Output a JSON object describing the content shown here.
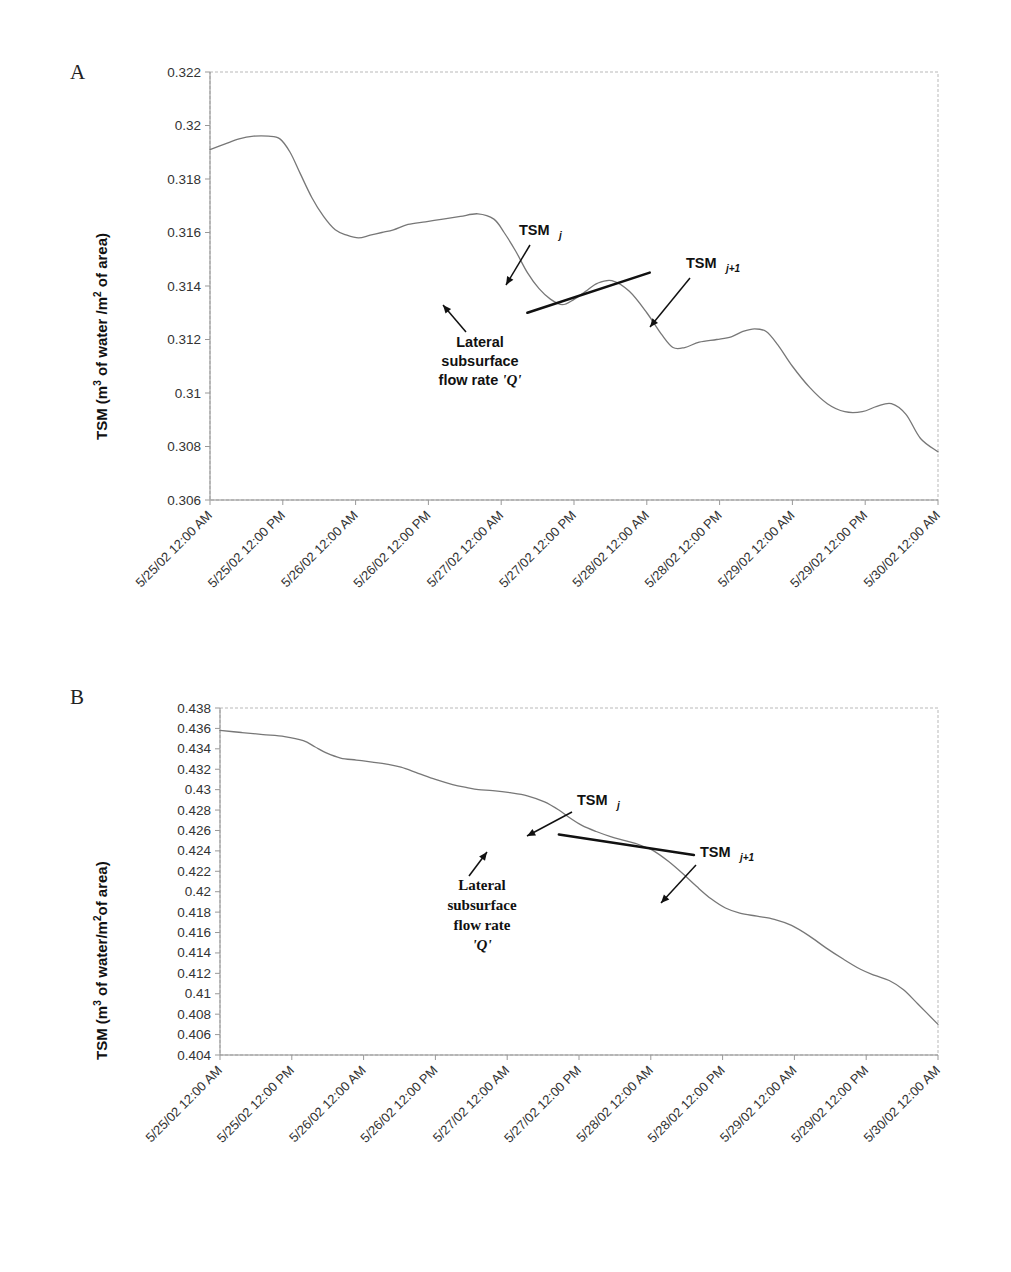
{
  "figure": {
    "panels": [
      {
        "letter": "A",
        "ylabel_prefix": "TSM (m",
        "ylabel_sup1": "3",
        "ylabel_mid": " of water /m",
        "ylabel_sup2": "2",
        "ylabel_suffix": " of area)",
        "annotations": {
          "tsm_j": "TSM",
          "tsm_j_sub": "j",
          "tsm_j1": "TSM",
          "tsm_j1_sub": "j+1",
          "lateral_line1": "Lateral",
          "lateral_line2": "subsurface",
          "lateral_line3": "flow rate",
          "lateral_q": "'Q'"
        }
      },
      {
        "letter": "B",
        "ylabel_prefix": "TSM (m",
        "ylabel_sup1": "3",
        "ylabel_mid": " of water/m",
        "ylabel_sup2": "2",
        "ylabel_suffix": "of area)",
        "annotations": {
          "tsm_j": "TSM",
          "tsm_j_sub": "j",
          "tsm_j1": "TSM",
          "tsm_j1_sub": "j+1",
          "lateral_line1": "Lateral",
          "lateral_line2": "subsurface",
          "lateral_line3": "flow rate",
          "lateral_q": "'Q'"
        }
      }
    ]
  },
  "chart_data": [
    {
      "type": "line",
      "panel": "A",
      "title": "",
      "xlabel": "",
      "ylabel": "TSM (m3 of water /m2 of area)",
      "ylim": [
        0.306,
        0.322
      ],
      "ytick_step": 0.002,
      "yticks": [
        0.322,
        0.32,
        0.318,
        0.316,
        0.314,
        0.312,
        0.31,
        0.308,
        0.306
      ],
      "ytick_labels": [
        "0.322",
        "0.32",
        "0.318",
        "0.316",
        "0.314",
        "0.312",
        "0.31",
        "0.308",
        "0.306"
      ],
      "xticks": [
        0,
        0.5,
        1,
        1.5,
        2,
        2.5,
        3,
        3.5,
        4,
        4.5,
        5
      ],
      "xtick_labels": [
        "5/25/02 12:00 AM",
        "5/25/02 12:00 PM",
        "5/26/02 12:00 AM",
        "5/26/02 12:00 PM",
        "5/27/02 12:00 AM",
        "5/27/02 12:00 PM",
        "5/28/02 12:00 AM",
        "5/28/02 12:00 PM",
        "5/29/02 12:00 AM",
        "5/29/02 12:00 PM",
        "5/30/02 12:00 AM"
      ],
      "xlim": [
        0,
        5
      ],
      "grid": false,
      "legend": "none",
      "x": [
        0.0,
        0.1,
        0.2,
        0.3,
        0.4,
        0.48,
        0.55,
        0.62,
        0.7,
        0.78,
        0.86,
        0.94,
        1.02,
        1.1,
        1.18,
        1.26,
        1.36,
        1.48,
        1.6,
        1.72,
        1.84,
        1.95,
        2.02,
        2.1,
        2.18,
        2.26,
        2.34,
        2.42,
        2.5,
        2.58,
        2.66,
        2.76,
        2.88,
        3.0,
        3.1,
        3.18,
        3.26,
        3.36,
        3.48,
        3.58,
        3.66,
        3.74,
        3.82,
        3.9,
        4.0,
        4.12,
        4.24,
        4.36,
        4.48,
        4.58,
        4.68,
        4.78,
        4.88,
        5.0
      ],
      "y": [
        0.3191,
        0.3193,
        0.3195,
        0.3196,
        0.3196,
        0.3195,
        0.319,
        0.3182,
        0.3173,
        0.3166,
        0.3161,
        0.3159,
        0.3158,
        0.3159,
        0.316,
        0.3161,
        0.3163,
        0.3164,
        0.3165,
        0.3166,
        0.3167,
        0.3165,
        0.316,
        0.3153,
        0.3145,
        0.3139,
        0.3135,
        0.3133,
        0.3135,
        0.3138,
        0.3141,
        0.3142,
        0.3138,
        0.313,
        0.3122,
        0.3117,
        0.3117,
        0.3119,
        0.312,
        0.3121,
        0.3123,
        0.3124,
        0.3123,
        0.3118,
        0.311,
        0.3102,
        0.3096,
        0.3093,
        0.3093,
        0.3095,
        0.3096,
        0.3092,
        0.3083,
        0.3078
      ],
      "tangent": {
        "x0": 2.18,
        "y0": 0.313,
        "x1": 3.02,
        "y1": 0.3145
      }
    },
    {
      "type": "line",
      "panel": "B",
      "title": "",
      "xlabel": "",
      "ylabel": "TSM (m3 of water/m2 of area)",
      "ylim": [
        0.404,
        0.438
      ],
      "ytick_step": 0.002,
      "yticks": [
        0.438,
        0.436,
        0.434,
        0.432,
        0.43,
        0.428,
        0.426,
        0.424,
        0.422,
        0.42,
        0.418,
        0.416,
        0.414,
        0.412,
        0.41,
        0.408,
        0.406,
        0.404
      ],
      "ytick_labels": [
        "0.438",
        "0.436",
        "0.434",
        "0.432",
        "0.43",
        "0.428",
        "0.426",
        "0.424",
        "0.422",
        "0.42",
        "0.418",
        "0.416",
        "0.414",
        "0.412",
        "0.41",
        "0.408",
        "0.406",
        "0.404"
      ],
      "xticks": [
        0,
        0.5,
        1,
        1.5,
        2,
        2.5,
        3,
        3.5,
        4,
        4.5,
        5
      ],
      "xtick_labels": [
        "5/25/02 12:00 AM",
        "5/25/02 12:00 PM",
        "5/26/02 12:00 AM",
        "5/26/02 12:00 PM",
        "5/27/02 12:00 AM",
        "5/27/02 12:00 PM",
        "5/28/02 12:00 AM",
        "5/28/02 12:00 PM",
        "5/29/02 12:00 AM",
        "5/29/02 12:00 PM",
        "5/30/02 12:00 AM"
      ],
      "xlim": [
        0,
        5
      ],
      "grid": false,
      "legend": "none",
      "x": [
        0.0,
        0.15,
        0.3,
        0.45,
        0.58,
        0.66,
        0.74,
        0.84,
        0.95,
        1.06,
        1.16,
        1.26,
        1.38,
        1.5,
        1.62,
        1.72,
        1.8,
        1.9,
        2.02,
        2.14,
        2.26,
        2.36,
        2.44,
        2.52,
        2.62,
        2.72,
        2.82,
        2.92,
        3.02,
        3.12,
        3.22,
        3.32,
        3.42,
        3.52,
        3.62,
        3.74,
        3.86,
        3.98,
        4.1,
        4.22,
        4.34,
        4.46,
        4.56,
        4.66,
        4.76,
        4.86,
        5.0
      ],
      "y": [
        0.4358,
        0.4356,
        0.4354,
        0.4352,
        0.4348,
        0.4342,
        0.4336,
        0.4331,
        0.4329,
        0.4327,
        0.4325,
        0.4322,
        0.4316,
        0.431,
        0.4305,
        0.4302,
        0.43,
        0.4299,
        0.4297,
        0.4294,
        0.4288,
        0.428,
        0.4272,
        0.4265,
        0.4259,
        0.4254,
        0.425,
        0.4246,
        0.424,
        0.423,
        0.4218,
        0.4205,
        0.4193,
        0.4184,
        0.4179,
        0.4176,
        0.4173,
        0.4167,
        0.4157,
        0.4145,
        0.4134,
        0.4124,
        0.4118,
        0.4113,
        0.4104,
        0.409,
        0.407
      ],
      "tangent": {
        "x0": 2.36,
        "y0": 0.4256,
        "x1": 3.3,
        "y1": 0.4236
      }
    }
  ]
}
